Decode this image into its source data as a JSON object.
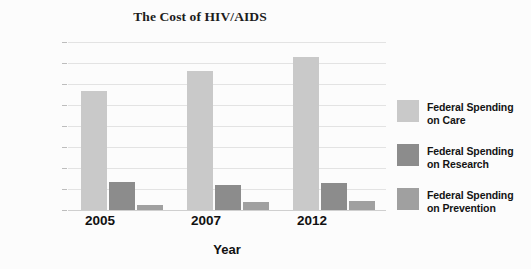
{
  "chart_data": {
    "type": "bar",
    "title": "The Cost of HIV/AIDS",
    "xlabel": "Year",
    "ylabel": "Billions of Dollars",
    "categories": [
      "2005",
      "2007",
      "2012"
    ],
    "ylim": [
      0,
      16
    ],
    "yticks": [
      0,
      2,
      4,
      6,
      8,
      10,
      12,
      14,
      16
    ],
    "ytick_labels": [
      "0",
      "2",
      "4",
      "6",
      "8",
      "10",
      "12",
      "14",
      "16"
    ],
    "grid": true,
    "legend_position": "right",
    "series": [
      {
        "name": "Federal Spending on Care",
        "label_line1": "Federal Spending",
        "label_line2": "on Care",
        "color": "#c9c9c9",
        "values": [
          11.3,
          13.2,
          14.6
        ]
      },
      {
        "name": "Federal Spending on Research",
        "label_line1": "Federal Spending",
        "label_line2": "on Research",
        "color": "#8c8c8c",
        "values": [
          2.7,
          2.4,
          2.6
        ]
      },
      {
        "name": "Federal Spending on Prevention",
        "label_line1": "Federal Spending",
        "label_line2": "on Prevention",
        "color": "#a0a0a0",
        "values": [
          0.5,
          0.75,
          0.85
        ]
      }
    ]
  }
}
